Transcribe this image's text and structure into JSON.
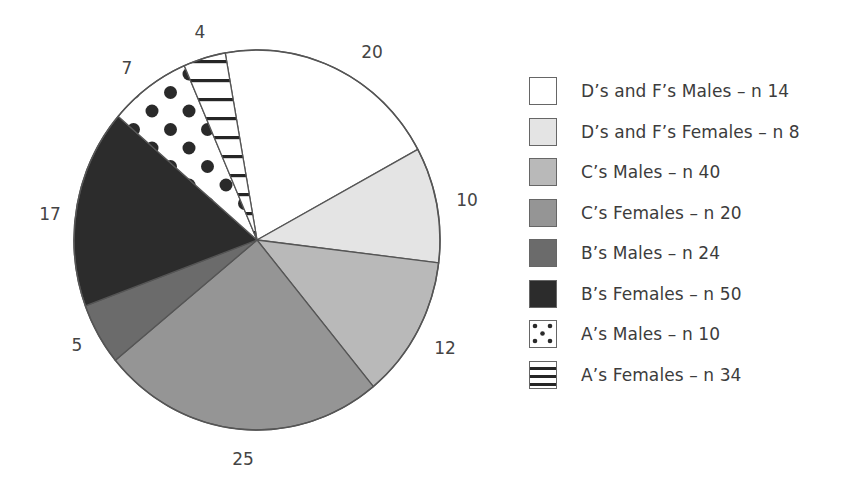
{
  "chart_data": {
    "type": "pie",
    "title": "",
    "unit": "%",
    "start_angle_deg": 350,
    "direction": "clockwise",
    "slices": [
      {
        "label": "D's and F's Males – n 14",
        "value": 4,
        "fill": "#ffffff",
        "pattern": "none"
      },
      {
        "label": "D's and F's Females – n 8",
        "value": 20,
        "fill": "#e4e4e4",
        "pattern": "none"
      },
      {
        "label": "C's Males – n 40",
        "value": 10,
        "fill": "#b9b9b9",
        "pattern": "none"
      },
      {
        "label": "C's Females – n 20",
        "value": 12,
        "fill": "#959595",
        "pattern": "none"
      },
      {
        "label": "B's Males – n 24",
        "value": 25,
        "fill": "#6b6b6b",
        "pattern": "none"
      },
      {
        "label": "B's Females – n 50",
        "value": 5,
        "fill": "#2c2c2c",
        "pattern": "none"
      },
      {
        "label": "A's Males – n 10",
        "value": 17,
        "fill": "#ffffff",
        "pattern": "dots"
      },
      {
        "label": "A's Females – n 34",
        "value": 7,
        "fill": "#ffffff",
        "pattern": "hlines"
      }
    ],
    "boundary_angles_deg": [
      350,
      61.5,
      96.9,
      140.5,
      230.7,
      249.7,
      310.6,
      336.6,
      350
    ],
    "data_labels": [
      {
        "text": "4",
        "x": 200,
        "y": 32
      },
      {
        "text": "20",
        "x": 372,
        "y": 52
      },
      {
        "text": "10",
        "x": 467,
        "y": 200
      },
      {
        "text": "12",
        "x": 445,
        "y": 348
      },
      {
        "text": "25",
        "x": 243,
        "y": 459
      },
      {
        "text": "5",
        "x": 77,
        "y": 345
      },
      {
        "text": "17",
        "x": 50,
        "y": 214
      },
      {
        "text": "7",
        "x": 127,
        "y": 68
      }
    ],
    "legend_position": "right",
    "geometry": {
      "cx": 257,
      "cy": 240,
      "rx": 183,
      "ry": 190
    }
  },
  "legend": {
    "items": [
      {
        "label": "D’s and F’s Males – n 14"
      },
      {
        "label": "D’s and F’s Females – n 8"
      },
      {
        "label": "C’s Males – n 40"
      },
      {
        "label": "C’s Females – n 20"
      },
      {
        "label": "B’s Males – n 24"
      },
      {
        "label": "B’s Females – n 50"
      },
      {
        "label": "A’s Males – n 10"
      },
      {
        "label": "A’s Females – n 34"
      }
    ]
  }
}
